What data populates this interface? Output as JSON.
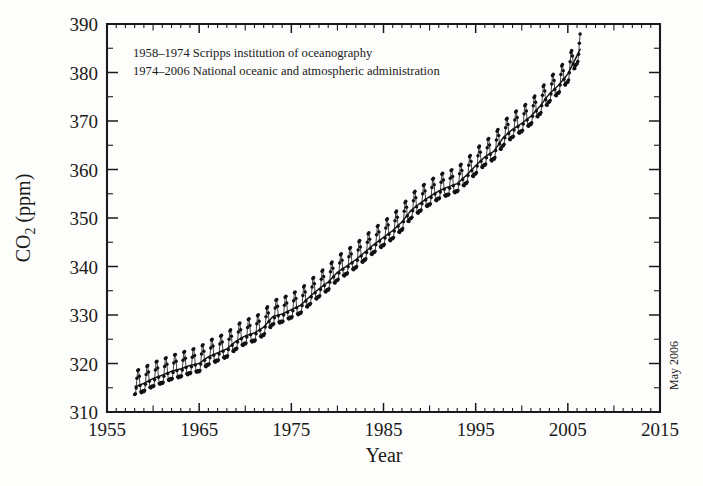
{
  "figure": {
    "name": "keeling-curve-co2",
    "background_color": "#fdfdfb",
    "ink_color": "#1a1a1a"
  },
  "annotations": {
    "line1": "1958–1974 Scripps institution of oceanography",
    "line2": "1974–2006 National oceanic and atmospheric administration",
    "side_note": "May 2006"
  },
  "chart_data": {
    "type": "line",
    "title": "",
    "subtitle": "",
    "xlabel": "Year",
    "ylabel": "CO2 (ppm)",
    "ylabel_display": "CO₂ (ppm)",
    "xlim": [
      1955,
      2015
    ],
    "ylim": [
      310,
      390
    ],
    "grid": false,
    "legend_position": "none",
    "x_ticks": [
      1955,
      1965,
      1975,
      1985,
      1995,
      2005,
      2015
    ],
    "x_tick_labels": [
      "1955",
      "1965",
      "1975",
      "1985",
      "1995",
      "2005",
      "2015"
    ],
    "x_minor_tick_step": 1,
    "x_medium_tick_step": 5,
    "y_ticks": [
      310,
      320,
      330,
      340,
      350,
      360,
      370,
      380,
      390
    ],
    "y_tick_labels": [
      "310",
      "320",
      "330",
      "340",
      "350",
      "360",
      "370",
      "380",
      "390"
    ],
    "y_minor_tick_step": 5,
    "data_start_year": 1958,
    "data_end_year": 2006.4,
    "seasonal_amplitude_ppm": 3.2,
    "marker": "filled-circle",
    "series": [
      {
        "name": "Monthly mean CO2 (Scripps / NOAA, Mauna Loa)",
        "description": "Monthly atmospheric CO2 with seasonal cycle",
        "x": [
          1958.2,
          1959,
          1960,
          1961,
          1962,
          1963,
          1964,
          1965,
          1966,
          1967,
          1968,
          1969,
          1970,
          1971,
          1972,
          1973,
          1974,
          1975,
          1976,
          1977,
          1978,
          1979,
          1980,
          1981,
          1982,
          1983,
          1984,
          1985,
          1986,
          1987,
          1988,
          1989,
          1990,
          1991,
          1992,
          1993,
          1994,
          1995,
          1996,
          1997,
          1998,
          1999,
          2000,
          2001,
          2002,
          2003,
          2004,
          2005,
          2006.4
        ],
        "values": [
          315.3,
          315.9,
          316.9,
          317.6,
          318.4,
          318.9,
          319.6,
          320.0,
          321.4,
          322.2,
          323.0,
          324.6,
          325.7,
          326.3,
          327.5,
          329.7,
          330.2,
          331.1,
          332.0,
          333.8,
          335.4,
          336.8,
          338.8,
          340.1,
          341.4,
          343.0,
          344.6,
          346.0,
          347.4,
          349.2,
          351.6,
          353.1,
          354.4,
          355.6,
          356.4,
          357.1,
          358.8,
          360.8,
          362.6,
          363.8,
          366.6,
          368.3,
          369.5,
          371.0,
          373.1,
          375.6,
          377.4,
          379.7,
          385.0
        ]
      }
    ]
  },
  "layout": {
    "plot_left_px": 107,
    "plot_right_px": 660,
    "plot_top_px": 24,
    "plot_bottom_px": 412
  }
}
